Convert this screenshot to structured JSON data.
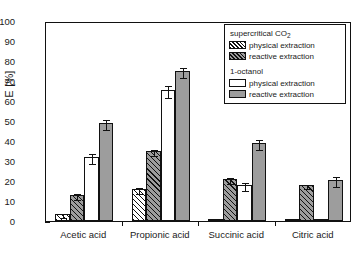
{
  "chart_data": {
    "type": "bar",
    "title": "",
    "xlabel": "",
    "ylabel": "E [%]",
    "ylim": [
      0,
      100
    ],
    "ytick_step": 10,
    "yminor_step": 5,
    "grid": false,
    "legend_position": "top-right",
    "categories": [
      "Acetic acid",
      "Propionic acid",
      "Succinic acid",
      "Citric acid"
    ],
    "ytick_labels": [
      "0",
      "10",
      "20",
      "30",
      "40",
      "50",
      "60",
      "70",
      "80",
      "90",
      "100"
    ],
    "series": [
      {
        "name": "supercritical CO2 - physical extraction",
        "group": "supercritical CO2",
        "label": "physical extraction",
        "style": "white-hatched",
        "values": [
          3.5,
          16.0,
          0.4,
          0.5
        ],
        "errors": [
          1.0,
          1.5,
          0.3,
          0.3
        ]
      },
      {
        "name": "supercritical CO2 - reactive extraction",
        "group": "supercritical CO2",
        "label": "reactive extraction",
        "style": "gray-hatched",
        "values": [
          13.0,
          35.0,
          21.0,
          18.0
        ],
        "errors": [
          1.5,
          1.5,
          1.5,
          0.8
        ]
      },
      {
        "name": "1-octanol - physical extraction",
        "group": "1-octanol",
        "label": "physical extraction",
        "style": "white",
        "values": [
          32.0,
          65.5,
          18.0,
          0.5
        ],
        "errors": [
          2.5,
          3.0,
          2.0,
          0.3
        ]
      },
      {
        "name": "1-octanol - reactive extraction",
        "group": "1-octanol",
        "label": "reactive extraction",
        "style": "gray",
        "values": [
          49.0,
          75.0,
          39.0,
          20.5
        ],
        "errors": [
          2.5,
          2.5,
          2.5,
          2.5
        ]
      }
    ]
  },
  "legend": {
    "groups": [
      {
        "title": "supercritical CO",
        "title_sub": "2",
        "rows": [
          {
            "label": "physical extraction",
            "style": "s0"
          },
          {
            "label": "reactive extraction",
            "style": "s1"
          }
        ]
      },
      {
        "title": "1-octanol",
        "title_sub": "",
        "rows": [
          {
            "label": "physical extraction",
            "style": "s2"
          },
          {
            "label": "reactive extraction",
            "style": "s3"
          }
        ]
      }
    ]
  },
  "colors": {
    "axis": "#111111",
    "gray_fill": "#9d9d9d",
    "white_fill": "#ffffff",
    "background": "#ffffff"
  }
}
